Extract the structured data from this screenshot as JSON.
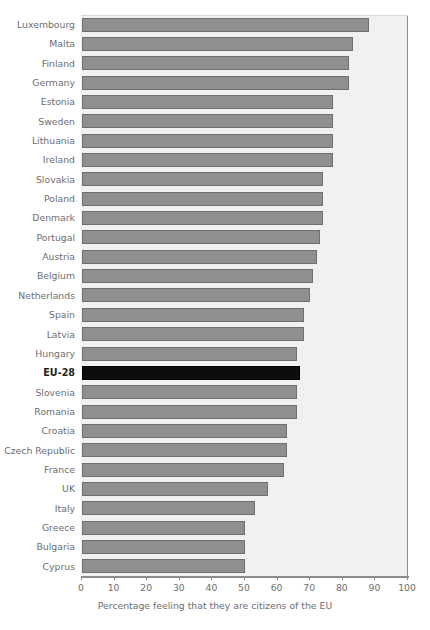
{
  "chart_data": {
    "type": "bar",
    "orientation": "horizontal",
    "title": "",
    "subtitle": "",
    "xlabel": "Percentage feeling that they are citizens of the EU",
    "ylabel": "",
    "xlim": [
      0,
      100
    ],
    "xticks": [
      0,
      10,
      20,
      30,
      40,
      50,
      60,
      70,
      80,
      90,
      100
    ],
    "xtick_labels": [
      "0",
      "10",
      "20",
      "30",
      "40",
      "50",
      "60",
      "70",
      "80",
      "90",
      "100"
    ],
    "grid": false,
    "legend": "none",
    "highlight_category": "EU-28",
    "highlight_color": "#0d0d0d",
    "bar_color": "#8f8f8f",
    "bar_edge_color": "#6f6f6f",
    "plot_background": "#f1f1f1",
    "categories": [
      "Luxembourg",
      "Malta",
      "Finland",
      "Germany",
      "Estonia",
      "Sweden",
      "Lithuania",
      "Ireland",
      "Slovakia",
      "Poland",
      "Denmark",
      "Portugal",
      "Austria",
      "Belgium",
      "Netherlands",
      "Spain",
      "Latvia",
      "Hungary",
      "EU-28",
      "Slovenia",
      "Romania",
      "Croatia",
      "Czech Republic",
      "France",
      "UK",
      "Italy",
      "Greece",
      "Bulgaria",
      "Cyprus"
    ],
    "values": [
      88,
      83,
      82,
      82,
      77,
      77,
      77,
      77,
      74,
      74,
      74,
      73,
      72,
      71,
      70,
      68,
      68,
      66,
      67,
      66,
      66,
      63,
      63,
      62,
      57,
      53,
      50,
      50,
      50
    ],
    "bars": [
      {
        "label": "Luxembourg",
        "value": 88,
        "highlighted": false
      },
      {
        "label": "Malta",
        "value": 83,
        "highlighted": false
      },
      {
        "label": "Finland",
        "value": 82,
        "highlighted": false
      },
      {
        "label": "Germany",
        "value": 82,
        "highlighted": false
      },
      {
        "label": "Estonia",
        "value": 77,
        "highlighted": false
      },
      {
        "label": "Sweden",
        "value": 77,
        "highlighted": false
      },
      {
        "label": "Lithuania",
        "value": 77,
        "highlighted": false
      },
      {
        "label": "Ireland",
        "value": 77,
        "highlighted": false
      },
      {
        "label": "Slovakia",
        "value": 74,
        "highlighted": false
      },
      {
        "label": "Poland",
        "value": 74,
        "highlighted": false
      },
      {
        "label": "Denmark",
        "value": 74,
        "highlighted": false
      },
      {
        "label": "Portugal",
        "value": 73,
        "highlighted": false
      },
      {
        "label": "Austria",
        "value": 72,
        "highlighted": false
      },
      {
        "label": "Belgium",
        "value": 71,
        "highlighted": false
      },
      {
        "label": "Netherlands",
        "value": 70,
        "highlighted": false
      },
      {
        "label": "Spain",
        "value": 68,
        "highlighted": false
      },
      {
        "label": "Latvia",
        "value": 68,
        "highlighted": false
      },
      {
        "label": "Hungary",
        "value": 66,
        "highlighted": false
      },
      {
        "label": "EU-28",
        "value": 67,
        "highlighted": true
      },
      {
        "label": "Slovenia",
        "value": 66,
        "highlighted": false
      },
      {
        "label": "Romania",
        "value": 66,
        "highlighted": false
      },
      {
        "label": "Croatia",
        "value": 63,
        "highlighted": false
      },
      {
        "label": "Czech Republic",
        "value": 63,
        "highlighted": false
      },
      {
        "label": "France",
        "value": 62,
        "highlighted": false
      },
      {
        "label": "UK",
        "value": 57,
        "highlighted": false
      },
      {
        "label": "Italy",
        "value": 53,
        "highlighted": false
      },
      {
        "label": "Greece",
        "value": 50,
        "highlighted": false
      },
      {
        "label": "Bulgaria",
        "value": 50,
        "highlighted": false
      },
      {
        "label": "Cyprus",
        "value": 50,
        "highlighted": false
      }
    ]
  }
}
